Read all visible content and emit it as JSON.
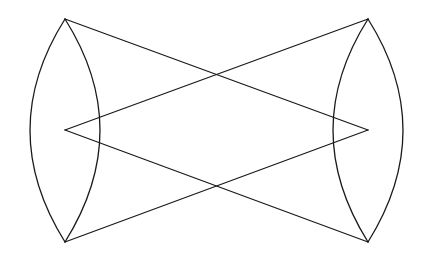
{
  "diagram": {
    "type": "geometric-line-figure",
    "stroke_color": "#1a1a1a",
    "background": "#ffffff",
    "points": {
      "top_left": [
        65,
        19
      ],
      "left_apex": [
        65,
        130
      ],
      "bottom_left": [
        65,
        242
      ],
      "top_right": [
        368,
        19
      ],
      "right_apex": [
        368,
        130
      ],
      "bottom_right": [
        368,
        242
      ]
    },
    "lines": [
      {
        "name": "top-left-to-right-apex",
        "from": [
          65,
          19
        ],
        "to": [
          368,
          130
        ]
      },
      {
        "name": "top-right-to-left-apex",
        "from": [
          368,
          19
        ],
        "to": [
          65,
          130
        ]
      },
      {
        "name": "bottom-left-to-right-apex",
        "from": [
          65,
          242
        ],
        "to": [
          368,
          130
        ]
      },
      {
        "name": "bottom-right-to-left-apex",
        "from": [
          368,
          242
        ],
        "to": [
          65,
          130
        ]
      }
    ],
    "arcs": [
      {
        "name": "left-outer-arc",
        "d": "M65,19 Q-5,130 65,242"
      },
      {
        "name": "left-inner-arc",
        "d": "M65,19 Q135,130 65,242"
      },
      {
        "name": "right-inner-arc",
        "d": "M368,19 Q298,130 368,242"
      },
      {
        "name": "right-outer-arc",
        "d": "M368,19 Q438,130 368,242"
      }
    ]
  }
}
